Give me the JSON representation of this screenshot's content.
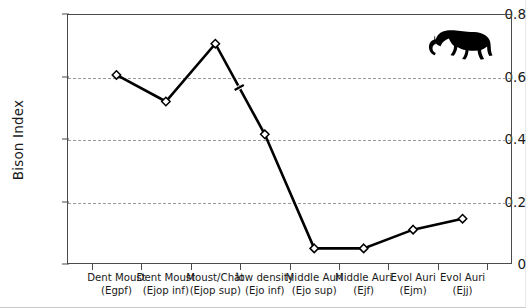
{
  "chart_data": {
    "type": "line",
    "title": "",
    "subtitle": "",
    "xlabel": "",
    "ylabel": "Bison Index",
    "ylim": [
      0,
      0.8
    ],
    "ytick_labels": [
      "0.8",
      "0.6",
      "0.4",
      "0.2",
      "0"
    ],
    "ytick_values": [
      0.8,
      0.6,
      0.4,
      0.2,
      0
    ],
    "grid": "horizontal-dashed",
    "legend": "none",
    "marker": "open-diamond",
    "line_color": "#000000",
    "categories": [
      "Dent Moust (Egpf)",
      "Dent Moust (Ejop inf)",
      "Moust/Chât (Ejop sup)",
      "low density (Ejo inf)",
      "Middle Auri (Ejo sup)",
      "Middle Auri (Ejf)",
      "Evol Auri (Ejm)",
      "Evol Auri (Ejj)"
    ],
    "category_lines": [
      [
        "Dent Moust",
        "(Egpf)"
      ],
      [
        "Dent Moust",
        "(Ejop inf)"
      ],
      [
        "Moust/Chât",
        "(Ejop sup)"
      ],
      [
        "low density",
        "(Ejo inf)"
      ],
      [
        "Middle Auri",
        "(Ejo sup)"
      ],
      [
        "Middle Auri",
        "(Ejf)"
      ],
      [
        "Evol Auri",
        "(Ejm)"
      ],
      [
        "Evol Auri",
        "(Ejj)"
      ]
    ],
    "values": [
      0.605,
      0.52,
      0.705,
      0.415,
      0.05,
      0.05,
      0.11,
      0.145
    ],
    "annotations": [
      {
        "name": "axis-break-tick",
        "between": [
          2,
          3
        ],
        "at_value": 0.565
      }
    ],
    "decorations": [
      {
        "name": "bison-silhouette",
        "color": "#000000"
      }
    ]
  },
  "axis": {
    "y_title": "Bison Index"
  }
}
